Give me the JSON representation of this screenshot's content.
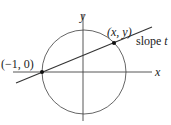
{
  "diagram": {
    "type": "unit-circle-rational-parametrization",
    "colors": {
      "stroke": "#444444",
      "point": "#111111",
      "text": "#222222",
      "background": "#ffffff"
    },
    "axes": {
      "x_label": "x",
      "y_label": "y"
    },
    "circle": {
      "description": "unit circle centered at origin"
    },
    "points": [
      {
        "label": "(−1, 0)",
        "role": "fixed-point"
      },
      {
        "label": "(x, y)",
        "role": "intersection-point"
      }
    ],
    "line": {
      "label_prefix": "slope ",
      "label_var": "t"
    }
  }
}
